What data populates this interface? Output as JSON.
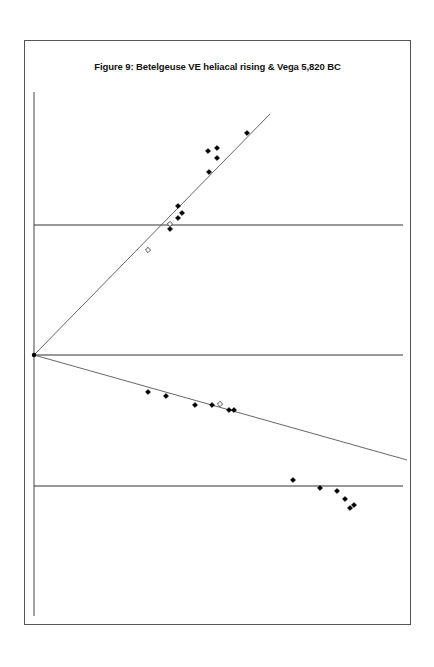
{
  "chart_data": {
    "type": "scatter",
    "title": "Figure 9: Betelgeuse VE heliacal rising & Vega 5,820 BC",
    "xlabel": "",
    "ylabel": "",
    "grid": false,
    "legend": null,
    "axes": {
      "x_pixel_range": [
        34,
        403
      ],
      "y_axis_pixel_range": [
        92,
        616
      ],
      "horizontal_reference_lines_px": [
        225,
        355,
        486
      ],
      "origin_px": [
        34,
        355
      ]
    },
    "trend_lines": [
      {
        "name": "upper-trend",
        "from_px": [
          34,
          355
        ],
        "to_px": [
          270,
          114
        ]
      },
      {
        "name": "lower-trend",
        "from_px": [
          34,
          355
        ],
        "to_px": [
          407,
          460
        ]
      }
    ],
    "series": [
      {
        "name": "upper-filled",
        "marker": "filled-diamond",
        "points_px": [
          [
            247,
            133
          ],
          [
            208,
            151
          ],
          [
            217,
            148
          ],
          [
            217,
            158
          ],
          [
            209,
            172
          ],
          [
            178,
            206
          ],
          [
            182,
            213
          ],
          [
            178,
            218
          ],
          [
            170,
            229
          ]
        ]
      },
      {
        "name": "upper-open",
        "marker": "open-diamond",
        "points_px": [
          [
            148,
            250
          ],
          [
            170,
            224
          ]
        ]
      },
      {
        "name": "lower-filled",
        "marker": "filled-diamond",
        "points_px": [
          [
            148,
            392
          ],
          [
            166,
            396
          ],
          [
            195,
            405
          ],
          [
            212,
            405
          ],
          [
            229,
            410
          ],
          [
            234,
            410
          ],
          [
            293,
            480
          ],
          [
            320,
            488
          ],
          [
            337,
            491
          ],
          [
            345,
            499
          ],
          [
            350,
            508
          ],
          [
            354,
            505
          ]
        ]
      },
      {
        "name": "lower-open",
        "marker": "open-diamond",
        "points_px": [
          [
            220,
            404
          ]
        ]
      }
    ]
  }
}
